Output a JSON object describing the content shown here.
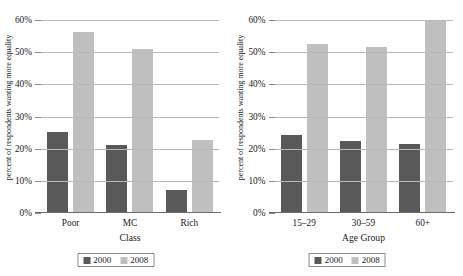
{
  "chart_data": [
    {
      "type": "bar",
      "title": "",
      "xlabel": "Class",
      "ylabel": "percent of respondents wanting more equality",
      "categories": [
        "Poor",
        "MC",
        "Rich"
      ],
      "series": [
        {
          "name": "2000",
          "color": "#595959",
          "values": [
            25.2,
            21.3,
            7.1
          ]
        },
        {
          "name": "2008",
          "color": "#bfbfbf",
          "values": [
            56.3,
            51.0,
            22.7
          ]
        }
      ],
      "ylim": [
        0,
        60
      ],
      "yticks": [
        0,
        10,
        20,
        30,
        40,
        50,
        60
      ],
      "ytick_labels": [
        "0%",
        "10%",
        "20%",
        "30%",
        "40%",
        "50%",
        "60%"
      ],
      "grid": true,
      "legend_position": "bottom",
      "legend_entries": [
        "2000",
        "2008"
      ]
    },
    {
      "type": "bar",
      "title": "",
      "xlabel": "Age Group",
      "ylabel": "percent of respondents wanting more equality",
      "categories": [
        "15–29",
        "30–59",
        "60+"
      ],
      "series": [
        {
          "name": "2000",
          "color": "#595959",
          "values": [
            24.2,
            22.5,
            21.4
          ]
        },
        {
          "name": "2008",
          "color": "#bfbfbf",
          "values": [
            52.5,
            51.5,
            59.8
          ]
        }
      ],
      "ylim": [
        0,
        60
      ],
      "yticks": [
        0,
        10,
        20,
        30,
        40,
        50,
        60
      ],
      "ytick_labels": [
        "0%",
        "10%",
        "20%",
        "30%",
        "40%",
        "50%",
        "60%"
      ],
      "grid": true,
      "legend_position": "bottom",
      "legend_entries": [
        "2000",
        "2008"
      ]
    }
  ]
}
